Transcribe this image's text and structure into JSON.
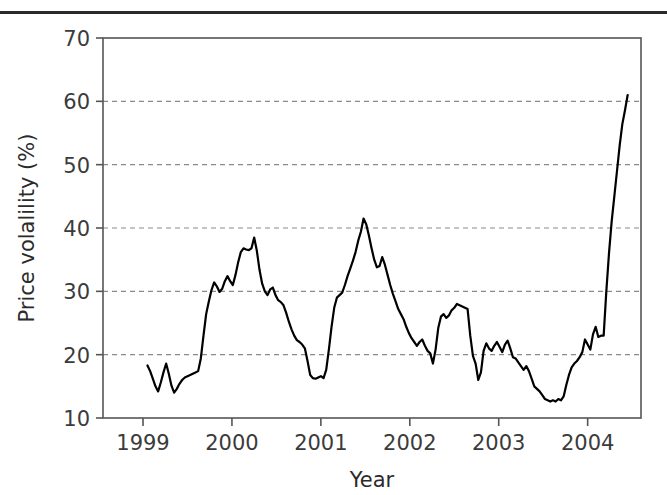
{
  "figure": {
    "has_top_rule": true,
    "background": "#ffffff"
  },
  "chart_data": {
    "type": "line",
    "title": "",
    "subtitle": "",
    "xlabel": "Year",
    "ylabel": "Price volalility (%)",
    "xlim": [
      1998.55,
      2004.6
    ],
    "ylim": [
      10,
      70
    ],
    "xticks": [
      1999,
      2000,
      2001,
      2002,
      2003,
      2004
    ],
    "xticklabels": [
      "1999",
      "2000",
      "2001",
      "2002",
      "2003",
      "2004"
    ],
    "yticks": [
      10,
      20,
      30,
      40,
      50,
      60,
      70
    ],
    "yticklabels": [
      "10",
      "20",
      "30",
      "40",
      "50",
      "60",
      "70"
    ],
    "grid": "horizontal-dashed",
    "grid_color": "#8a8a8a",
    "legend": null,
    "line_color": "#000000",
    "line_width": 2.2,
    "series": [
      {
        "name": "Price volatility",
        "x": [
          1999.05,
          1999.08,
          1999.11,
          1999.14,
          1999.17,
          1999.2,
          1999.23,
          1999.26,
          1999.29,
          1999.32,
          1999.35,
          1999.38,
          1999.41,
          1999.44,
          1999.47,
          1999.5,
          1999.53,
          1999.56,
          1999.59,
          1999.62,
          1999.65,
          1999.68,
          1999.71,
          1999.74,
          1999.77,
          1999.8,
          1999.83,
          1999.86,
          1999.89,
          1999.92,
          1999.95,
          1999.98,
          2000.01,
          2000.04,
          2000.07,
          2000.1,
          2000.13,
          2000.16,
          2000.19,
          2000.22,
          2000.25,
          2000.28,
          2000.31,
          2000.34,
          2000.37,
          2000.4,
          2000.43,
          2000.46,
          2000.49,
          2000.52,
          2000.55,
          2000.58,
          2000.61,
          2000.64,
          2000.67,
          2000.7,
          2000.73,
          2000.76,
          2000.79,
          2000.82,
          2000.85,
          2000.88,
          2000.91,
          2000.94,
          2000.97,
          2001.0,
          2001.03,
          2001.06,
          2001.09,
          2001.12,
          2001.15,
          2001.18,
          2001.21,
          2001.24,
          2001.27,
          2001.3,
          2001.33,
          2001.36,
          2001.39,
          2001.42,
          2001.45,
          2001.48,
          2001.51,
          2001.54,
          2001.57,
          2001.6,
          2001.63,
          2001.66,
          2001.69,
          2001.72,
          2001.75,
          2001.78,
          2001.81,
          2001.84,
          2001.87,
          2001.9,
          2001.93,
          2001.96,
          2001.99,
          2002.02,
          2002.05,
          2002.08,
          2002.11,
          2002.14,
          2002.17,
          2002.2,
          2002.23,
          2002.26,
          2002.29,
          2002.32,
          2002.35,
          2002.38,
          2002.41,
          2002.44,
          2002.47,
          2002.5,
          2002.53,
          2002.56,
          2002.59,
          2002.62,
          2002.65,
          2002.68,
          2002.71,
          2002.74,
          2002.77,
          2002.8,
          2002.83,
          2002.86,
          2002.89,
          2002.92,
          2002.95,
          2002.98,
          2003.01,
          2003.04,
          2003.07,
          2003.1,
          2003.13,
          2003.16,
          2003.19,
          2003.22,
          2003.25,
          2003.28,
          2003.31,
          2003.34,
          2003.37,
          2003.4,
          2003.43,
          2003.46,
          2003.49,
          2003.52,
          2003.55,
          2003.58,
          2003.61,
          2003.64,
          2003.67,
          2003.7,
          2003.73,
          2003.76,
          2003.79,
          2003.82,
          2003.85,
          2003.88,
          2003.91,
          2003.94,
          2003.97,
          2004.0,
          2004.03,
          2004.06,
          2004.09,
          2004.12,
          2004.15,
          2004.18,
          2004.21,
          2004.24,
          2004.27,
          2004.3,
          2004.33,
          2004.36,
          2004.39,
          2004.42,
          2004.45
        ],
        "y": [
          18.3,
          17.4,
          16.2,
          15.0,
          14.2,
          15.6,
          17.2,
          18.6,
          17.0,
          15.1,
          14.0,
          14.6,
          15.4,
          16.0,
          16.4,
          16.6,
          16.8,
          17.0,
          17.2,
          17.4,
          19.4,
          23.0,
          26.4,
          28.4,
          30.2,
          31.4,
          30.8,
          29.9,
          30.4,
          31.6,
          32.4,
          31.6,
          31.0,
          32.6,
          34.6,
          36.2,
          36.8,
          36.6,
          36.5,
          36.8,
          38.5,
          36.4,
          33.4,
          31.2,
          30.0,
          29.4,
          30.3,
          30.6,
          29.4,
          28.6,
          28.3,
          27.8,
          26.6,
          25.2,
          24.0,
          23.0,
          22.3,
          22.0,
          21.6,
          21.0,
          19.0,
          16.8,
          16.3,
          16.2,
          16.4,
          16.6,
          16.3,
          17.6,
          20.8,
          24.4,
          27.4,
          29.0,
          29.4,
          29.8,
          31.0,
          32.4,
          33.6,
          34.8,
          36.2,
          38.0,
          39.4,
          41.5,
          40.6,
          38.8,
          36.8,
          35.0,
          33.8,
          34.0,
          35.4,
          34.2,
          32.6,
          31.0,
          29.6,
          28.4,
          27.2,
          26.4,
          25.6,
          24.4,
          23.4,
          22.6,
          22.0,
          21.4,
          22.0,
          22.4,
          21.4,
          20.6,
          20.2,
          18.6,
          20.8,
          24.2,
          26.0,
          26.4,
          25.8,
          26.2,
          27.0,
          27.4,
          28.0,
          27.8,
          27.6,
          27.4,
          27.2,
          23.0,
          19.8,
          18.6,
          16.0,
          17.2,
          20.6,
          21.8,
          21.0,
          20.6,
          21.4,
          22.0,
          21.2,
          20.4,
          21.6,
          22.2,
          21.0,
          19.6,
          19.4,
          18.8,
          18.2,
          17.6,
          18.2,
          17.4,
          16.2,
          15.0,
          14.6,
          14.2,
          13.6,
          13.0,
          12.8,
          12.6,
          12.8,
          12.6,
          13.0,
          12.8,
          13.4,
          15.2,
          16.8,
          18.0,
          18.6,
          19.0,
          19.6,
          20.4,
          22.4,
          21.6,
          20.8,
          23.2,
          24.4,
          22.8,
          23.0,
          23.0,
          30.0,
          36.0,
          41.0,
          45.0,
          49.0,
          53.0,
          56.4,
          58.6,
          61.0
        ]
      }
    ]
  }
}
